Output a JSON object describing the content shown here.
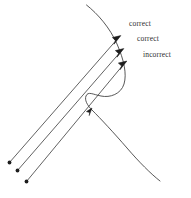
{
  "figure": {
    "title": "",
    "background_color": "#ffffff",
    "stroke_color": "#3a3a3a",
    "text_color": "#2b2b2b",
    "width": 191,
    "height": 198,
    "labels": [
      {
        "id": "correct-1",
        "text": "correct"
      },
      {
        "id": "correct-2",
        "text": "correct"
      },
      {
        "id": "incorrect",
        "text": "incorrect"
      }
    ],
    "curve": {
      "name": "s-shaped-curve",
      "description": "sigmoid wave curve running from top-left down to bottom-right"
    },
    "rays": [
      {
        "id": "ray-1",
        "label_ref": "correct-1"
      },
      {
        "id": "ray-2",
        "label_ref": "correct-2"
      },
      {
        "id": "ray-3",
        "label_ref": "incorrect"
      }
    ]
  }
}
